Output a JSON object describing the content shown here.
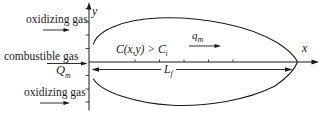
{
  "figure": {
    "background": "#ffffff",
    "ink": "#1a1a1a"
  },
  "inlets": {
    "oxidizing_top": "oxidizing gas",
    "combustible": "combustible gas",
    "mass_flow": {
      "base": "Q",
      "sub": "m"
    },
    "oxidizing_bottom": "oxidizing gas"
  },
  "axes": {
    "x": "x",
    "y": "y"
  },
  "flame": {
    "concentration": {
      "base": "C(x,y) > C",
      "sub": "i"
    },
    "mass_flux": {
      "base": "q",
      "sub": "m"
    },
    "length": {
      "base": "L",
      "sub": "f"
    }
  }
}
